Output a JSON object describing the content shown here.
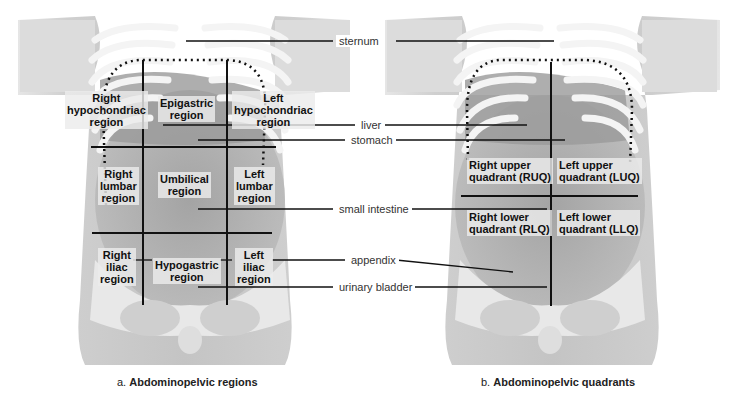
{
  "figure_a": {
    "caption_prefix": "a.",
    "caption_title": "Abdominopelvic regions",
    "regions": {
      "right_hypochondriac": [
        "Right",
        "hypochondriac",
        "region"
      ],
      "epigastric": [
        "Epigastric",
        "region"
      ],
      "left_hypochondriac": [
        "Left",
        "hypochondriac",
        "region"
      ],
      "right_lumbar": [
        "Right",
        "lumbar",
        "region"
      ],
      "umbilical": [
        "Umbilical",
        "region"
      ],
      "left_lumbar": [
        "Left",
        "lumbar",
        "region"
      ],
      "right_iliac": [
        "Right",
        "iliac",
        "region"
      ],
      "hypogastric": [
        "Hypogastric",
        "region"
      ],
      "left_iliac": [
        "Left",
        "iliac",
        "region"
      ]
    }
  },
  "figure_b": {
    "caption_prefix": "b.",
    "caption_title": "Abdominopelvic quadrants",
    "quadrants": {
      "ruq": [
        "Right upper",
        "quadrant (RUQ)"
      ],
      "luq": [
        "Left upper",
        "quadrant (LUQ)"
      ],
      "rlq": [
        "Right lower",
        "quadrant (RLQ)"
      ],
      "llq": [
        "Left lower",
        "quadrant (LLQ)"
      ]
    }
  },
  "callouts": {
    "sternum": "sternum",
    "liver": "liver",
    "stomach": "stomach",
    "small_intestine": "small intestine",
    "appendix": "appendix",
    "urinary_bladder": "urinary bladder"
  },
  "colors": {
    "skin": "#d9d9d9",
    "rib": "#f2f2f2",
    "organ": "#a8a8a8",
    "line": "#111111"
  }
}
